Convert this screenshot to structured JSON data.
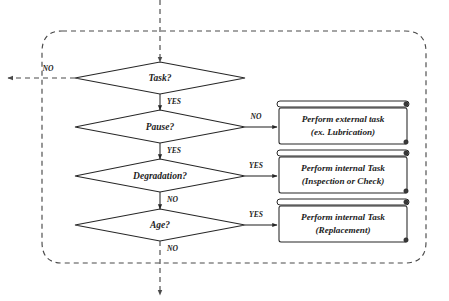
{
  "diagram": {
    "background_color": "#ffffff",
    "line_color": "#262626",
    "dashed_color": "#4a4a4a",
    "boundary": {
      "name": "dashed-process-boundary",
      "style": "dashed-rounded-rectangle"
    },
    "entry": {
      "label": "",
      "style": "dashed-arrow-down"
    },
    "exit": {
      "label": "NO",
      "style": "dashed-arrow-down"
    },
    "side_exit": {
      "label": "NO",
      "style": "dashed-arrow-left"
    },
    "decisions": [
      {
        "id": "task",
        "label": "Task?",
        "yes": "YES",
        "no": "NO"
      },
      {
        "id": "pause",
        "label": "Pause?",
        "yes": "YES",
        "no": "NO"
      },
      {
        "id": "degradation",
        "label": "Degradation?",
        "yes": "YES",
        "no": "NO"
      },
      {
        "id": "age",
        "label": "Age?",
        "yes": "YES",
        "no": "NO"
      }
    ],
    "processes": [
      {
        "id": "external-task",
        "line1": "Perform external task",
        "line2": "(ex. Lubrication)",
        "from": "pause",
        "branch": "NO"
      },
      {
        "id": "internal-inspection",
        "line1": "Perform internal Task",
        "line2": "(Inspection or Check)",
        "from": "degradation",
        "branch": "YES"
      },
      {
        "id": "internal-replacement",
        "line1": "Perform internal Task",
        "line2": "(Replacement)",
        "from": "age",
        "branch": "YES"
      }
    ],
    "edge_labels": {
      "task_yes": "YES",
      "task_no": "NO",
      "pause_yes": "YES",
      "pause_no": "NO",
      "degradation_yes": "YES",
      "degradation_no": "NO",
      "age_yes": "YES",
      "age_no": "NO"
    }
  }
}
